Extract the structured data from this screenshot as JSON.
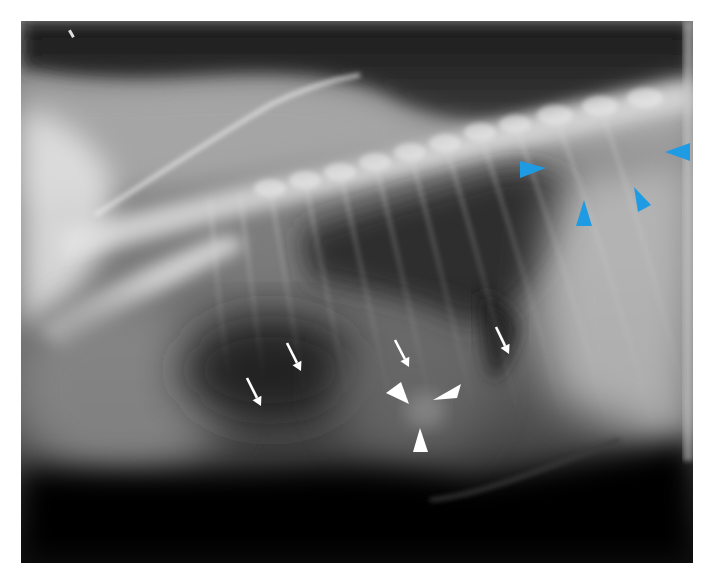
{
  "figure": {
    "kind": "lateral thoracic radiograph",
    "frame": {
      "x": 21,
      "y": 21,
      "width": 672,
      "height": 542
    },
    "colors": {
      "background": "#ffffff",
      "blue_marker": "#1e9be3",
      "white_marker": "#ffffff"
    }
  },
  "annotations": {
    "blue_arrowheads": [
      {
        "id": "blue-1",
        "points": "520,161 520,178 546,168"
      },
      {
        "id": "blue-2",
        "points": "690,143 690,161 665,152"
      },
      {
        "id": "blue-3",
        "points": "576,226 592,226 584,200"
      },
      {
        "id": "blue-4",
        "points": "634,187 638,212 651,205"
      }
    ],
    "white_arrows": [
      {
        "id": "arrow-a",
        "x1": 287,
        "y1": 343,
        "x2": 301,
        "y2": 371
      },
      {
        "id": "arrow-b",
        "x1": 247,
        "y1": 378,
        "x2": 261,
        "y2": 406
      },
      {
        "id": "arrow-c",
        "x1": 395,
        "y1": 340,
        "x2": 409,
        "y2": 367
      },
      {
        "id": "arrow-d",
        "x1": 496,
        "y1": 327,
        "x2": 509,
        "y2": 354
      }
    ],
    "white_arrowheads": [
      {
        "id": "white-left",
        "points": "386,393 401,382 409,404"
      },
      {
        "id": "white-right",
        "points": "461,384 457,398 433,400"
      },
      {
        "id": "white-bottom",
        "points": "413,452 428,452 420,428"
      }
    ]
  }
}
